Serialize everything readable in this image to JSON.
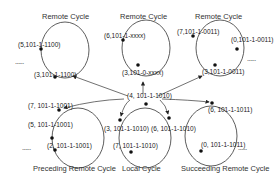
{
  "cycles": {
    "remote_left": {
      "title": "Remote Cycle",
      "nodes": [
        "(5,101-1-1100)",
        "(3,101-1-1100)"
      ],
      "ellipsis": "......"
    },
    "remote_center": {
      "title": "Remote Cycle",
      "nodes": [
        "(6,101-1-xxxx)",
        "(3,101-0-xxxx)"
      ]
    },
    "remote_right": {
      "title": "Remote Cycle",
      "nodes": [
        "(7,101-1-0011)",
        "(0,101-1-0011)",
        "(3,101-1-0011)"
      ],
      "ellipsis": "......"
    },
    "preceding": {
      "title": "Preceding Remote Cycle",
      "nodes": [
        "(7, 101-1-1001)",
        "(5, 101-1-1001)",
        "(2, 101-1-1001)"
      ],
      "ellipsis": "......"
    },
    "local": {
      "title": "Local Cycle",
      "nodes": [
        "(4, 101-1-1010)",
        "(3, 101-1-1010)",
        "(6, 101-1-1010)",
        "(7, 101-1-1010)"
      ]
    },
    "succeeding": {
      "title": "Succeeding Remote Cycle",
      "nodes": [
        "(6, 101-1-1011)",
        "(0, 101-1-1011)"
      ],
      "ellipsis": "......"
    }
  },
  "colors": {
    "line": "#333333",
    "node": "#111111"
  }
}
